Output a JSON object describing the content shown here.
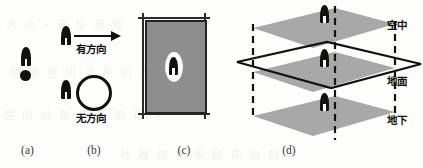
{
  "figure": {
    "width": 423,
    "height": 168,
    "background_color": "#fdfdfc",
    "ink_color": "#111110",
    "plane_fill_color": "#a8a8a8",
    "cell_fill_color": "#8e8e8e"
  },
  "ghost_text": [
    "大 小 • 定 位 有 效",
    "物 体 空 间 关 系 的 表 达",
    "空 间 分 布 与 图 形 符 号",
    "地 理 信 息 系 统 中 的 符 号"
  ],
  "panels": [
    {
      "id": "a",
      "label": "(a)",
      "name": "panel-point-symbol",
      "elements": {
        "person_icon": "person-icon",
        "dot_icon": "dot-icon"
      }
    },
    {
      "id": "b",
      "label": "(b)",
      "name": "panel-orientation",
      "elements": {
        "directional_label": "有方向",
        "nondirectional_label": "无方向",
        "arrow_icon": "arrow-right-icon",
        "ring_icon": "circle-outline-icon",
        "person_icon": "person-icon"
      }
    },
    {
      "id": "c",
      "label": "(c)",
      "name": "panel-cell-symbol",
      "elements": {
        "cell_icon": "grid-cell-icon",
        "highlight_icon": "ellipse-highlight-icon",
        "person_icon": "person-icon"
      }
    },
    {
      "id": "d",
      "label": "(d)",
      "name": "panel-vertical-layers",
      "layers": [
        {
          "key": "air",
          "label": "空中",
          "name": "layer-label-air"
        },
        {
          "key": "ground",
          "label": "地面",
          "name": "layer-label-ground"
        },
        {
          "key": "underground",
          "label": "地下",
          "name": "layer-label-underground"
        }
      ],
      "elements": {
        "plane_icon": "plane-parallelogram-icon",
        "outline_icon": "ground-outline-icon",
        "dashed_icon": "dashed-vertical-line-icon",
        "person_icon": "person-icon"
      }
    }
  ]
}
